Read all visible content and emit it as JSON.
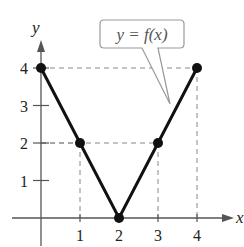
{
  "chart_data": {
    "type": "line",
    "title": "",
    "xlabel": "x",
    "ylabel": "y",
    "x": [
      0,
      1,
      2,
      3,
      4
    ],
    "series": [
      {
        "name": "y = f(x)",
        "values": [
          4,
          2,
          0,
          2,
          4
        ]
      }
    ],
    "xticks": [
      "1",
      "2",
      "3",
      "4"
    ],
    "yticks": [
      "1",
      "2",
      "3",
      "4"
    ],
    "xlim": [
      -0.5,
      5
    ],
    "ylim": [
      -0.6,
      5
    ],
    "grid": false,
    "guide_lines": "dashed projections from points to axes",
    "annotation": {
      "text": "y = f(x)",
      "style": "speech-bubble callout pointing to right branch"
    },
    "colors": {
      "line": "#111111",
      "axis": "#555555",
      "dashed": "#888888",
      "callout_border": "#999999"
    }
  }
}
